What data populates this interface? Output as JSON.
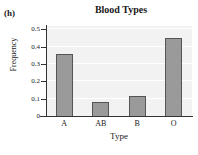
{
  "panel": {
    "label": "(h)"
  },
  "chart_data": {
    "type": "bar",
    "title": "Blood Types",
    "xlabel": "Type",
    "ylabel": "Frequency",
    "categories": [
      "A",
      "AB",
      "B",
      "O"
    ],
    "values": [
      0.36,
      0.08,
      0.115,
      0.45
    ],
    "ylim": [
      0,
      0.52
    ],
    "yticks": [
      0,
      0.1,
      0.2,
      0.3,
      0.4,
      0.5
    ],
    "ytick_labels": [
      "0",
      "0.1",
      "0.2",
      "0.3",
      "0.4",
      "0.5"
    ],
    "grid": true,
    "legend": null,
    "bar_color": "#9a9a9a",
    "bar_edge_color": "#555555",
    "plot_background": "#f2f2f2",
    "axis_color": "#333333"
  }
}
